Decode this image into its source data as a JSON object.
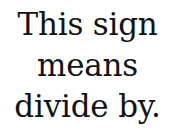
{
  "image": {
    "background_color": "#ffffff",
    "text_color": "#131313",
    "caption": {
      "lines": [
        {
          "text": "This sign"
        },
        {
          "text": "means"
        },
        {
          "text": "divide by."
        }
      ],
      "full_text": "This sign means divide by."
    }
  }
}
